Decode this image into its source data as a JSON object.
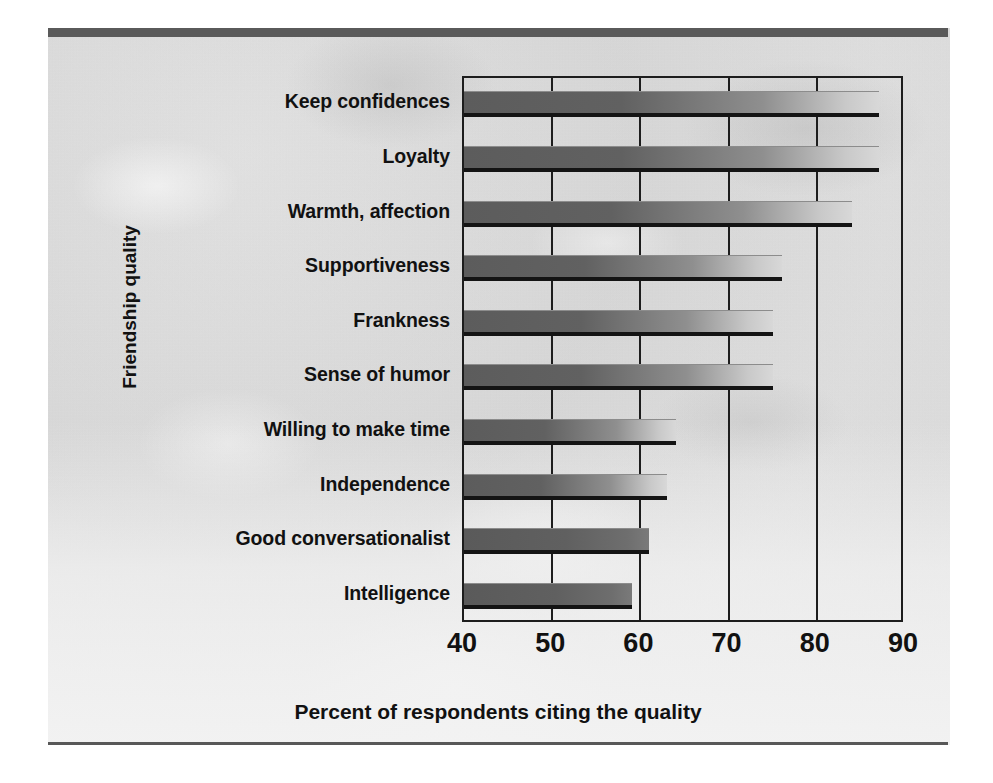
{
  "chart_data": {
    "type": "bar",
    "orientation": "horizontal",
    "title": "",
    "xlabel": "Percent of respondents citing the quality",
    "ylabel": "Friendship quality",
    "xlim": [
      40,
      90
    ],
    "xticks": [
      "40",
      "50",
      "60",
      "70",
      "80",
      "90"
    ],
    "xtick_values": [
      40,
      50,
      60,
      70,
      80,
      90
    ],
    "grid": "vertical",
    "legend": "none",
    "categories": [
      "Keep confidences",
      "Loyalty",
      "Warmth, affection",
      "Supportiveness",
      "Frankness",
      "Sense of humor",
      "Willing to make time",
      "Independence",
      "Good conversationalist",
      "Intelligence"
    ],
    "values": [
      87,
      87,
      84,
      76,
      75,
      75,
      64,
      63,
      61,
      59
    ],
    "bar_color_dark": "#5c5c5c",
    "bar_color_light": "#d8d8d8",
    "axis_color": "#1d1d1d",
    "text_color": "#111111",
    "background_color": "#dedede"
  },
  "figure": {
    "rule_color": "#5a5a5a"
  }
}
